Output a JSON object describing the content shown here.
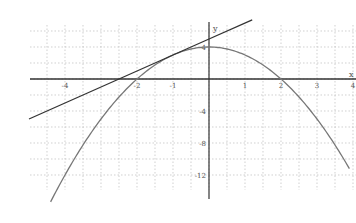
{
  "chart_data": {
    "type": "line",
    "title": "",
    "xlabel": "x",
    "ylabel": "y",
    "xlim": [
      -5,
      4
    ],
    "ylim": [
      -14,
      7
    ],
    "grid": true,
    "legend": null,
    "x_tick_labels": [
      "-4",
      "-2",
      "-1",
      "1",
      "2",
      "3",
      "4"
    ],
    "x_ticks": [
      -4,
      -2,
      -1,
      1,
      2,
      3,
      4
    ],
    "y_tick_labels": [
      "4",
      "-4",
      "-8",
      "-12"
    ],
    "y_ticks": [
      4,
      -4,
      -8,
      -12
    ],
    "series": [
      {
        "name": "parabola y = 4 - x^2",
        "color": "#777777",
        "x": [
          -4.4,
          -4,
          -3,
          -2,
          -1,
          0,
          1,
          2,
          3,
          3.9
        ],
        "y": [
          -15.36,
          -12,
          -5,
          0,
          3,
          4,
          3,
          0,
          -5,
          -11.21
        ]
      },
      {
        "name": "tangent line y = 2x + 5 at x = -1",
        "color": "#333333",
        "x": [
          -5,
          -2.5,
          -1,
          0,
          1.2
        ],
        "y": [
          -5,
          0,
          3,
          5,
          7.4
        ]
      }
    ],
    "annotations": [
      {
        "label": "tangent point",
        "x": -1,
        "y": 3
      },
      {
        "label": "vertex",
        "x": 0,
        "y": 4
      }
    ]
  },
  "axes": {
    "x_name": "x",
    "y_name": "y"
  },
  "colors": {
    "axis": "#333333",
    "grid": "#bbbbbb",
    "curve": "#777777",
    "tangent": "#333333",
    "background": "#ffffff"
  }
}
